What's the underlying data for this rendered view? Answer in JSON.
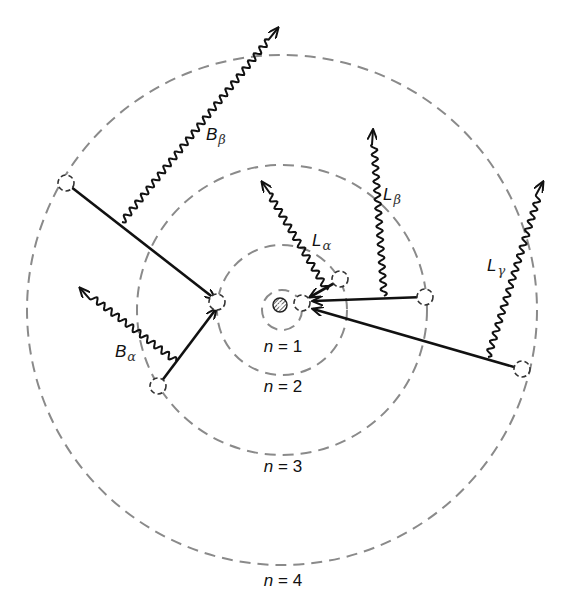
{
  "diagram": {
    "center": {
      "x": 282,
      "y": 310
    },
    "nucleus": {
      "x": 280,
      "y": 305,
      "r": 7
    },
    "orbits": [
      {
        "n": 1,
        "r": 20,
        "label": "n = 1",
        "label_x": 283,
        "label_y": 352
      },
      {
        "n": 2,
        "r": 65,
        "label": "n = 2",
        "label_x": 283,
        "label_y": 392
      },
      {
        "n": 3,
        "r": 145,
        "label": "n = 3",
        "label_x": 283,
        "label_y": 472
      },
      {
        "n": 4,
        "r": 255,
        "label": "n = 4",
        "label_x": 283,
        "label_y": 586
      }
    ],
    "transitions": [
      {
        "name": "B-beta",
        "from_n": 4,
        "to_n": 2,
        "x1": 66,
        "y1": 183,
        "x2": 215,
        "y2": 299
      },
      {
        "name": "B-alpha",
        "from_n": 3,
        "to_n": 2,
        "x1": 158,
        "y1": 386,
        "x2": 216,
        "y2": 309
      },
      {
        "name": "L-alpha",
        "from_n": 2,
        "to_n": 1,
        "x1": 338,
        "y1": 281,
        "x2": 310,
        "y2": 297
      },
      {
        "name": "L-beta",
        "from_n": 3,
        "to_n": 1,
        "x1": 424,
        "y1": 297,
        "x2": 313,
        "y2": 301
      },
      {
        "name": "L-gamma",
        "from_n": 4,
        "to_n": 1,
        "x1": 521,
        "y1": 369,
        "x2": 313,
        "y2": 309
      }
    ],
    "photons": [
      {
        "name": "B-beta",
        "main": "B",
        "sub": "β",
        "x1": 122,
        "y1": 222,
        "x2": 278,
        "y2": 28,
        "label_x": 206,
        "label_y": 140
      },
      {
        "name": "B-alpha",
        "main": "B",
        "sub": "α",
        "x1": 176,
        "y1": 361,
        "x2": 80,
        "y2": 288,
        "label_x": 115,
        "label_y": 357
      },
      {
        "name": "L-alpha",
        "main": "L",
        "sub": "α",
        "x1": 327,
        "y1": 290,
        "x2": 262,
        "y2": 182,
        "label_x": 312,
        "label_y": 246
      },
      {
        "name": "L-beta",
        "main": "L",
        "sub": "β",
        "x1": 384,
        "y1": 296,
        "x2": 373,
        "y2": 130,
        "label_x": 383,
        "label_y": 200
      },
      {
        "name": "L-gamma",
        "main": "L",
        "sub": "γ",
        "x1": 488,
        "y1": 357,
        "x2": 543,
        "y2": 182,
        "label_x": 487,
        "label_y": 271
      }
    ],
    "electrons": [
      {
        "n": 1,
        "x": 302,
        "y": 303
      },
      {
        "n": 2,
        "x": 340,
        "y": 279
      },
      {
        "n": 2,
        "x": 217,
        "y": 302
      },
      {
        "n": 3,
        "x": 425,
        "y": 297
      },
      {
        "n": 3,
        "x": 158,
        "y": 386
      },
      {
        "n": 4,
        "x": 66,
        "y": 183
      },
      {
        "n": 4,
        "x": 522,
        "y": 369
      }
    ],
    "colors": {
      "orbit": "#8a8a8a",
      "line": "#111111",
      "background": "#ffffff"
    }
  }
}
